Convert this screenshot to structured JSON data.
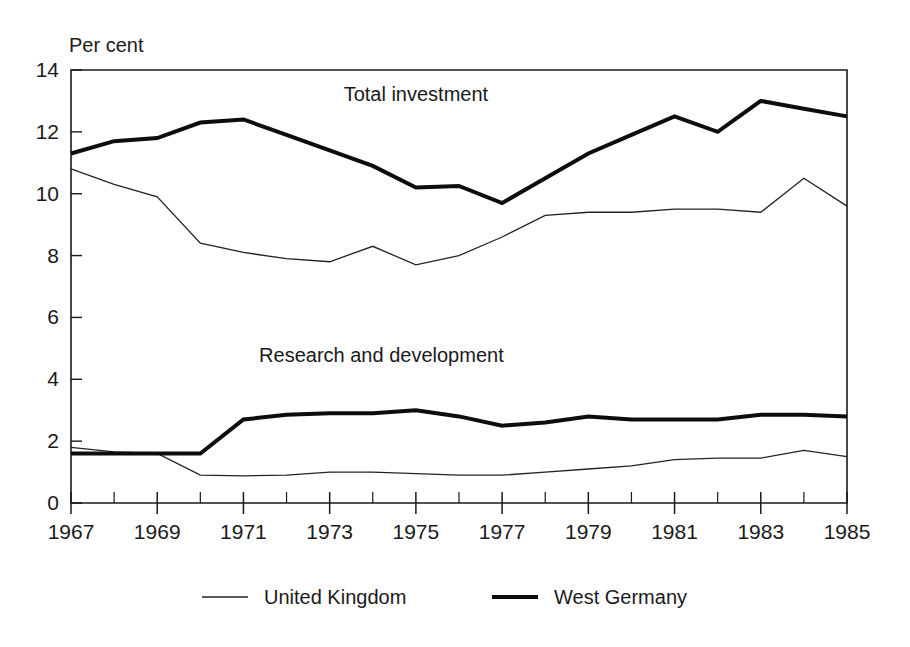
{
  "chart_data": {
    "type": "line",
    "title": "",
    "subtitle": "",
    "unit_label": "Per cent",
    "xlabel": "",
    "ylabel": "Per cent",
    "ylim": [
      0,
      14
    ],
    "xlim": [
      1967,
      1985
    ],
    "grid": false,
    "y_ticks": [
      "0",
      "2",
      "4",
      "6",
      "8",
      "10",
      "12",
      "14"
    ],
    "y_tick_values": [
      0,
      2,
      4,
      6,
      8,
      10,
      12,
      14
    ],
    "x_ticks": [
      "1967",
      "1969",
      "1971",
      "1973",
      "1975",
      "1977",
      "1979",
      "1981",
      "1983",
      "1985"
    ],
    "x_tick_values": [
      1967,
      1969,
      1971,
      1973,
      1975,
      1977,
      1979,
      1981,
      1983,
      1985
    ],
    "x_minor_ticks": [
      1968,
      1970,
      1972,
      1974,
      1976,
      1978,
      1980,
      1982,
      1984
    ],
    "x": [
      1967,
      1968,
      1969,
      1970,
      1971,
      1972,
      1973,
      1974,
      1975,
      1976,
      1977,
      1978,
      1979,
      1980,
      1981,
      1982,
      1983,
      1984,
      1985
    ],
    "annotations": [
      {
        "text": "Total investment",
        "x": 1975,
        "y": 13.0
      },
      {
        "text": "Research and development",
        "x": 1974.2,
        "y": 4.55
      }
    ],
    "legend_position": "bottom",
    "legend": [
      {
        "label": "United Kingdom",
        "style": "thin"
      },
      {
        "label": "West Germany",
        "style": "thick"
      }
    ],
    "groups": [
      {
        "name": "Total investment",
        "series": [
          {
            "name": "United Kingdom",
            "style": "thin",
            "values": [
              10.8,
              10.3,
              9.9,
              8.4,
              8.1,
              7.9,
              7.8,
              8.3,
              7.7,
              8.0,
              8.6,
              9.3,
              9.4,
              9.4,
              9.5,
              9.5,
              9.4,
              10.5,
              9.6
            ]
          },
          {
            "name": "West Germany",
            "style": "thick",
            "values": [
              11.3,
              11.7,
              11.8,
              12.3,
              12.4,
              11.9,
              11.4,
              10.9,
              10.2,
              10.25,
              9.7,
              10.5,
              11.3,
              11.9,
              12.5,
              12.0,
              13.0,
              12.75,
              12.5
            ]
          }
        ]
      },
      {
        "name": "Research and development",
        "series": [
          {
            "name": "United Kingdom",
            "style": "thin",
            "values": [
              1.8,
              1.65,
              1.6,
              0.9,
              0.88,
              0.9,
              1.0,
              1.0,
              0.95,
              0.9,
              0.9,
              1.0,
              1.1,
              1.2,
              1.4,
              1.45,
              1.45,
              1.7,
              1.5
            ]
          },
          {
            "name": "West Germany",
            "style": "thick",
            "values": [
              1.6,
              1.6,
              1.6,
              1.6,
              2.7,
              2.85,
              2.9,
              2.9,
              3.0,
              2.8,
              2.5,
              2.6,
              2.8,
              2.7,
              2.7,
              2.7,
              2.85,
              2.85,
              2.8
            ]
          }
        ]
      }
    ]
  }
}
